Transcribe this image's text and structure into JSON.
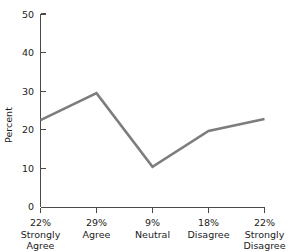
{
  "chart_data": {
    "type": "line",
    "title": "",
    "xlabel": "",
    "ylabel": "Percent",
    "ylim": [
      0,
      50
    ],
    "yticks": [
      0,
      10,
      20,
      30,
      40,
      50
    ],
    "ytick_labels": [
      "0",
      "10",
      "20",
      "30",
      "40",
      "50"
    ],
    "grid": false,
    "legend": "none",
    "line_color": "#7d7d7d",
    "axis_color": "#4a4a4a",
    "categories": [
      "Strongly Agree",
      "Agree",
      "Neutral",
      "Disagree",
      "Strongly Disagree"
    ],
    "category_lines": [
      [
        "Strongly",
        "Agree"
      ],
      [
        "Agree",
        ""
      ],
      [
        "Neutral",
        ""
      ],
      [
        "Disagree",
        ""
      ],
      [
        "Strongly",
        "Disagree"
      ]
    ],
    "percent_labels": [
      "22%",
      "29%",
      "9%",
      "18%",
      "22%"
    ],
    "values": [
      22.5,
      29.5,
      10.4,
      19.7,
      22.8
    ],
    "series": [
      {
        "name": "Percent",
        "values": [
          22.5,
          29.5,
          10.4,
          19.7,
          22.8
        ]
      }
    ]
  }
}
